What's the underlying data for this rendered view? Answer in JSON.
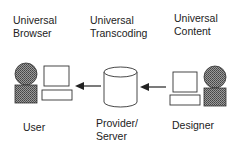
{
  "top_labels": {
    "browser": "Universal\nBrowser",
    "transcoding": "Universal\nTranscoding",
    "content": "Universal\nContent"
  },
  "bottom_labels": {
    "user": "User",
    "server": "Provider/\nServer",
    "designer": "Designer"
  },
  "nodes": [
    {
      "id": "user",
      "icon": "person-with-computer-icon"
    },
    {
      "id": "server",
      "icon": "database-cylinder-icon"
    },
    {
      "id": "designer",
      "icon": "computer-with-person-icon"
    }
  ],
  "edges": [
    {
      "from": "designer",
      "to": "server"
    },
    {
      "from": "server",
      "to": "user"
    }
  ],
  "colors": {
    "fill_dark": "#6e6e6e",
    "stroke": "#333333"
  }
}
